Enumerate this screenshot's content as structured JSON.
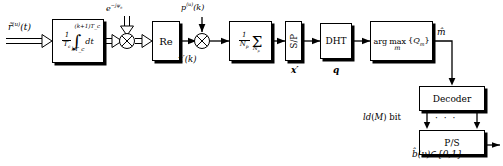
{
  "diagram": {
    "signals": {
      "input": "r̃⁽ᵘ⁾(t)",
      "phase_rotator": "e⁻ʲᴪ⁰",
      "despread_code": "p⁽ᵘ⁾(k)",
      "after_re": "x′(k)",
      "after_sp": "x′",
      "after_dht": "q",
      "after_argmax": "m̂",
      "decoder_out": "ld(M) bit",
      "output": "b̂(ν)∈{0,1}"
    },
    "blocks": {
      "integrator": {
        "name": "integrate-and-dump",
        "prefactor_num": "1",
        "prefactor_den": "T_c",
        "upper_limit": "(k+1)T_c",
        "lower_limit": "kT_c",
        "integral_glyph": "∫",
        "differential": "dt"
      },
      "mixer1": {
        "name": "phase-derotation-multiplier",
        "glyph": "⊗"
      },
      "re": {
        "name": "real-part",
        "label": "Re"
      },
      "mixer2": {
        "name": "despreading-multiplier",
        "glyph": "⊗"
      },
      "averager": {
        "name": "coherent-averager",
        "prefactor_num": "1",
        "prefactor_den": "N_p",
        "sum_glyph": "Σ",
        "sum_index": "N_p"
      },
      "sp": {
        "name": "serial-to-parallel",
        "label": "S/P"
      },
      "dht": {
        "name": "discrete-hartley-transform",
        "label": "DHT"
      },
      "argmax": {
        "name": "maximum-likelihood-detector",
        "line1": "arg max{Q_m}",
        "arg_text": "arg",
        "max_text": "max",
        "index_text": "m",
        "set_text": "{Q_m}"
      },
      "decoder": {
        "name": "decoder",
        "label": "Decoder"
      },
      "ps": {
        "name": "parallel-to-serial",
        "label": "P/S"
      }
    },
    "ellipsis": "· · ·"
  }
}
